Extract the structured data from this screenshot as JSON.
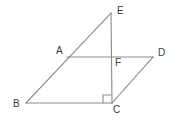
{
  "figure": {
    "background_color": "#ffffff",
    "line_color": "#8a8a8a",
    "label_color": "#3c3c3c",
    "points": [
      {
        "name": "E",
        "label": "E",
        "x": 111,
        "y": 13,
        "label_x": 117,
        "label_y": 11
      },
      {
        "name": "A",
        "label": "A",
        "x": 67,
        "y": 57,
        "label_x": 56,
        "label_y": 51
      },
      {
        "name": "F",
        "label": "F",
        "x": 112,
        "y": 57,
        "label_x": 115,
        "label_y": 63
      },
      {
        "name": "D",
        "label": "D",
        "x": 153,
        "y": 57,
        "label_x": 158,
        "label_y": 53
      },
      {
        "name": "B",
        "label": "B",
        "x": 26,
        "y": 103,
        "label_x": 13,
        "label_y": 104
      },
      {
        "name": "C",
        "label": "C",
        "x": 112,
        "y": 103,
        "label_x": 113,
        "label_y": 110
      }
    ],
    "segments": [
      {
        "name": "segment-BE",
        "from": "B",
        "to": "E",
        "x1": 26,
        "y1": 103,
        "x2": 111,
        "y2": 13
      },
      {
        "name": "segment-EC",
        "from": "E",
        "to": "C",
        "x1": 111,
        "y1": 13,
        "x2": 112,
        "y2": 103
      },
      {
        "name": "segment-BC",
        "from": "B",
        "to": "C",
        "x1": 26,
        "y1": 103,
        "x2": 112,
        "y2": 103
      },
      {
        "name": "segment-AD",
        "from": "A",
        "to": "D",
        "x1": 67,
        "y1": 57,
        "x2": 153,
        "y2": 57
      },
      {
        "name": "segment-CD",
        "from": "C",
        "to": "D",
        "x1": 112,
        "y1": 103,
        "x2": 153,
        "y2": 57
      }
    ],
    "right_angle": {
      "name": "right-angle-mark-at-C",
      "at": "C",
      "path": "M 103 103 L 103 95 L 111 95"
    }
  }
}
